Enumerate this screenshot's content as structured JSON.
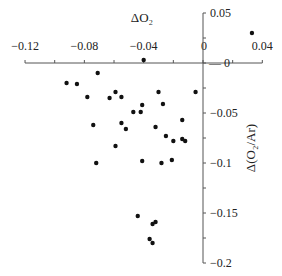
{
  "chart_data": {
    "type": "scatter",
    "title": "",
    "xlabel": "ΔO₂",
    "ylabel": "Δ(O₂/Ar)",
    "xlim": [
      -0.12,
      0.04
    ],
    "ylim": [
      -0.2,
      0.05
    ],
    "x_ticks": [
      -0.12,
      -0.1,
      -0.08,
      -0.06,
      -0.04,
      -0.02,
      0,
      0.02,
      0.04
    ],
    "x_tick_labels": [
      "−0.12",
      "−0.08",
      "−0.04",
      "0",
      "0.04"
    ],
    "x_tick_label_values": [
      -0.12,
      -0.08,
      -0.04,
      0,
      0.04
    ],
    "y_ticks": [
      0.05,
      0.025,
      0,
      -0.025,
      -0.05,
      -0.075,
      -0.1,
      -0.125,
      -0.15,
      -0.175,
      -0.2
    ],
    "y_tick_labels": [
      "0.05",
      "0",
      "−0.05",
      "−0.1",
      "−0.15",
      "−0.2"
    ],
    "y_tick_label_values": [
      0.05,
      0,
      -0.05,
      -0.1,
      -0.15,
      -0.2
    ],
    "grid": false,
    "legend": null,
    "series": [
      {
        "name": "observations",
        "color": "#111111",
        "points": [
          [
            0.033,
            0.03
          ],
          [
            -0.04,
            0.003
          ],
          [
            -0.092,
            -0.02
          ],
          [
            -0.085,
            -0.021
          ],
          [
            -0.071,
            -0.01
          ],
          [
            -0.078,
            -0.034
          ],
          [
            -0.063,
            -0.035
          ],
          [
            -0.059,
            -0.029
          ],
          [
            -0.055,
            -0.034
          ],
          [
            -0.074,
            -0.062
          ],
          [
            -0.055,
            -0.06
          ],
          [
            -0.052,
            -0.066
          ],
          [
            -0.059,
            -0.083
          ],
          [
            -0.072,
            -0.1
          ],
          [
            -0.03,
            -0.029
          ],
          [
            -0.005,
            -0.029
          ],
          [
            -0.027,
            -0.041
          ],
          [
            -0.041,
            -0.042
          ],
          [
            -0.047,
            -0.049
          ],
          [
            -0.042,
            -0.049
          ],
          [
            -0.014,
            -0.057
          ],
          [
            -0.032,
            -0.064
          ],
          [
            -0.025,
            -0.073
          ],
          [
            -0.02,
            -0.078
          ],
          [
            -0.014,
            -0.076
          ],
          [
            -0.012,
            -0.078
          ],
          [
            -0.041,
            -0.098
          ],
          [
            -0.028,
            -0.1
          ],
          [
            -0.021,
            -0.097
          ],
          [
            -0.044,
            -0.153
          ],
          [
            -0.034,
            -0.161
          ],
          [
            -0.032,
            -0.159
          ],
          [
            -0.036,
            -0.176
          ],
          [
            -0.034,
            -0.18
          ]
        ]
      }
    ]
  }
}
